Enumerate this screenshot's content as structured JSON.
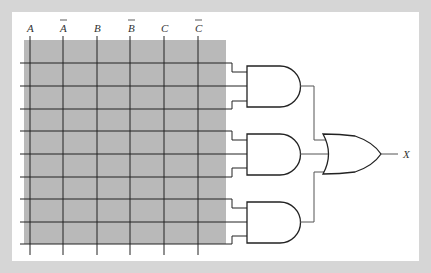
{
  "diagram": {
    "title": "",
    "type": "PLA / programmable AND-OR array",
    "input_labels": [
      "A",
      "A",
      "B",
      "B",
      "C",
      "C"
    ],
    "input_overbar": [
      false,
      true,
      false,
      true,
      false,
      true
    ],
    "output_label": "X",
    "and_gates": 3,
    "or_gates": 1,
    "inputs_per_and_gate": 3,
    "colors": {
      "background": "#d6d6d6",
      "panel": "#ffffff",
      "array_fill": "#b8b8b8",
      "lines": "#222222"
    }
  }
}
